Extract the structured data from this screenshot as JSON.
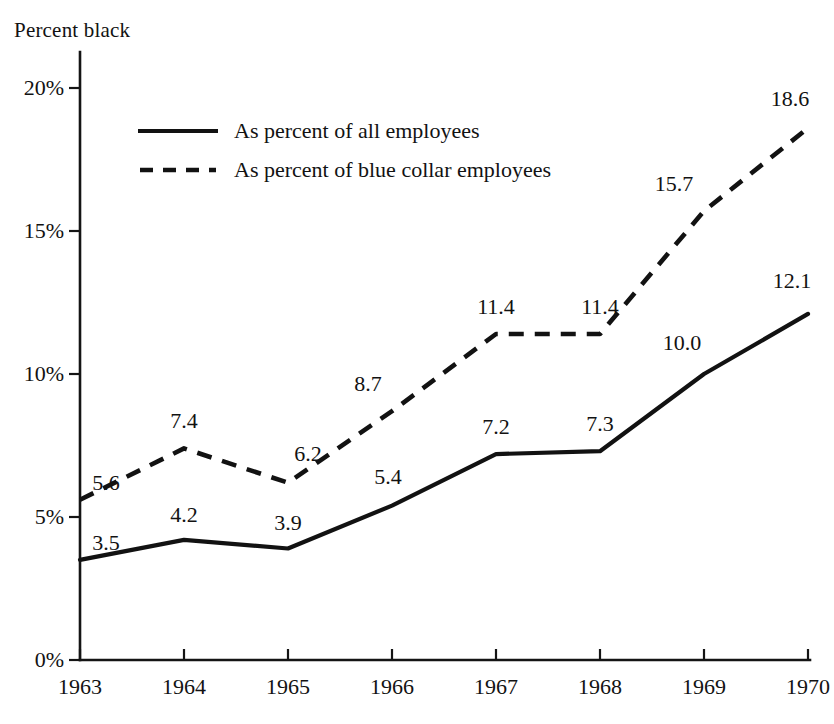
{
  "chart_data": {
    "type": "line",
    "title": "Percent black",
    "xlabel": "",
    "ylabel": "Percent black",
    "categories": [
      "1963",
      "1964",
      "1965",
      "1966",
      "1967",
      "1968",
      "1969",
      "1970"
    ],
    "x": [
      1963,
      1964,
      1965,
      1966,
      1967,
      1968,
      1969,
      1970
    ],
    "ylim": [
      0,
      20
    ],
    "xlim": [
      1963,
      1970
    ],
    "grid": false,
    "legend_position": "upper left inside",
    "ytick_labels": [
      "0%",
      "5%",
      "10%",
      "15%",
      "20%"
    ],
    "ytick_values": [
      0,
      5,
      10,
      15,
      20
    ],
    "series": [
      {
        "name": "As percent of all employees",
        "style": "solid",
        "color": "#121212",
        "values": [
          3.5,
          4.2,
          3.9,
          5.4,
          7.2,
          7.3,
          10.0,
          12.1
        ],
        "labels": [
          "3.5",
          "4.2",
          "3.9",
          "5.4",
          "7.2",
          "7.3",
          "10.0",
          "12.1"
        ]
      },
      {
        "name": "As percent of blue collar employees",
        "style": "dashed",
        "color": "#121212",
        "values": [
          5.6,
          7.4,
          6.2,
          8.7,
          11.4,
          11.4,
          15.7,
          18.6
        ],
        "labels": [
          "5.6",
          "7.4",
          "6.2",
          "8.7",
          "11.4",
          "11.4",
          "15.7",
          "18.6"
        ]
      }
    ]
  },
  "axis": {
    "y_title": "Percent black",
    "y_ticks": [
      {
        "label_num": "20",
        "label_pct": "%",
        "value": 20
      },
      {
        "label_num": "15",
        "label_pct": "%",
        "value": 15
      },
      {
        "label_num": "10",
        "label_pct": "%",
        "value": 10
      },
      {
        "label_num": "5",
        "label_pct": "%",
        "value": 5
      },
      {
        "label_num": "0",
        "label_pct": "%",
        "value": 0
      }
    ],
    "x_ticks": [
      "1963",
      "1964",
      "1965",
      "1966",
      "1967",
      "1968",
      "1969",
      "1970"
    ]
  },
  "legend": {
    "entries": [
      {
        "label": "As percent of all employees",
        "style": "solid"
      },
      {
        "label": "As percent of blue collar employees",
        "style": "dashed"
      }
    ]
  }
}
